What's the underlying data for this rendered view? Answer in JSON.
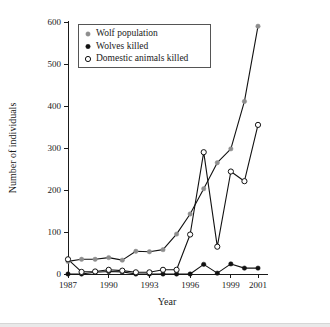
{
  "chart_data": {
    "type": "line",
    "title": "",
    "xlabel": "Year",
    "ylabel": "Number of individuals",
    "x": [
      1987,
      1988,
      1989,
      1990,
      1991,
      1992,
      1993,
      1994,
      1995,
      1996,
      1997,
      1998,
      1999,
      2000,
      2001
    ],
    "xlim": [
      1987,
      2001
    ],
    "ylim": [
      0,
      600
    ],
    "xticks": [
      1987,
      1990,
      1993,
      1996,
      1999,
      2001
    ],
    "xticklabels": [
      "1987",
      "1990",
      "1993",
      "1996",
      "1999",
      "2001"
    ],
    "yticks": [
      0,
      100,
      200,
      300,
      400,
      500,
      600
    ],
    "yticklabels": [
      "0",
      "100",
      "200",
      "300",
      "400",
      "500",
      "600"
    ],
    "grid": false,
    "legend_position": "top-left",
    "series": [
      {
        "name": "Wolf population",
        "marker": "filled-circle",
        "marker_color": "#8e8e8e",
        "line_color": "#111111",
        "values": [
          30,
          35,
          35,
          39,
          33,
          54,
          53,
          58,
          95,
          143,
          203,
          265,
          298,
          411,
          590
        ]
      },
      {
        "name": "Wolves killed",
        "marker": "filled-circle",
        "marker_color": "#111111",
        "line_color": "#111111",
        "values": [
          0,
          0,
          4,
          6,
          5,
          0,
          0,
          0,
          0,
          0,
          23,
          2,
          24,
          14,
          14
        ]
      },
      {
        "name": "Domestic animals killed",
        "marker": "open-circle",
        "marker_color": "#ffffff",
        "line_color": "#111111",
        "values": [
          35,
          5,
          6,
          10,
          8,
          4,
          4,
          10,
          10,
          94,
          290,
          65,
          244,
          221,
          355
        ]
      }
    ]
  },
  "legend": {
    "entries": [
      {
        "label": "Wolf population",
        "marker": "gray-filled-circle-marker"
      },
      {
        "label": "Wolves killed",
        "marker": "black-filled-circle-marker"
      },
      {
        "label": "Domestic animals killed",
        "marker": "open-circle-marker"
      }
    ]
  },
  "colors": {
    "wolf_population": "#8e8e8e",
    "wolves_killed": "#111111",
    "domestic_animals_killed": "#ffffff",
    "line": "#111111",
    "axis": "#1a1a1a",
    "background": "#ffffff"
  }
}
